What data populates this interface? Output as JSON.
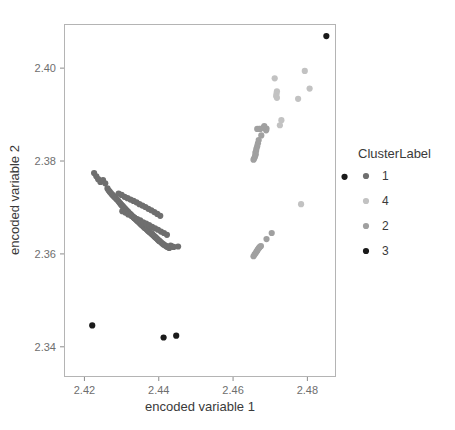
{
  "chart_data": {
    "type": "scatter",
    "title": "",
    "xlabel": "encoded variable 1",
    "ylabel": "encoded variable 2",
    "xlim": [
      2.4145,
      2.4877
    ],
    "ylim": [
      2.3335,
      2.4095
    ],
    "xticks": [
      2.42,
      2.44,
      2.46,
      2.48
    ],
    "xticklabels": [
      "2.42",
      "2.44",
      "2.46",
      "2.48"
    ],
    "yticks": [
      2.34,
      2.36,
      2.38,
      2.4
    ],
    "yticklabels": [
      "2.34",
      "2.36",
      "2.38",
      "2.40"
    ],
    "grid": false,
    "legend": {
      "title": "ClusterLabel",
      "position": "right",
      "entries": [
        {
          "label": "1",
          "color": "#6f6f6f"
        },
        {
          "label": "4",
          "color": "#c2c2c2"
        },
        {
          "label": "2",
          "color": "#a0a0a0"
        },
        {
          "label": "3",
          "color": "#1a1a1a"
        }
      ]
    },
    "marker_size": 3.1,
    "series": [
      {
        "name": "1",
        "color": "#6f6f6f",
        "points": [
          [
            2.4226,
            2.3774
          ],
          [
            2.4232,
            2.3767
          ],
          [
            2.4237,
            2.3761
          ],
          [
            2.4243,
            2.3755
          ],
          [
            2.425,
            2.3759
          ],
          [
            2.4256,
            2.3752
          ],
          [
            2.4262,
            2.3741
          ],
          [
            2.4265,
            2.3737
          ],
          [
            2.4268,
            2.3734
          ],
          [
            2.4271,
            2.3731
          ],
          [
            2.4274,
            2.3728
          ],
          [
            2.4277,
            2.3726
          ],
          [
            2.428,
            2.3723
          ],
          [
            2.4283,
            2.3721
          ],
          [
            2.4286,
            2.3718
          ],
          [
            2.4289,
            2.3716
          ],
          [
            2.4292,
            2.3713
          ],
          [
            2.4295,
            2.371
          ],
          [
            2.4297,
            2.3708
          ],
          [
            2.4299,
            2.3706
          ],
          [
            2.4301,
            2.3704
          ],
          [
            2.4303,
            2.3703
          ],
          [
            2.4305,
            2.3701
          ],
          [
            2.4307,
            2.3699
          ],
          [
            2.4309,
            2.3697
          ],
          [
            2.4311,
            2.3696
          ],
          [
            2.4313,
            2.3694
          ],
          [
            2.4315,
            2.3692
          ],
          [
            2.4317,
            2.3691
          ],
          [
            2.4319,
            2.3689
          ],
          [
            2.4321,
            2.3687
          ],
          [
            2.4323,
            2.3686
          ],
          [
            2.4325,
            2.3684
          ],
          [
            2.4327,
            2.3683
          ],
          [
            2.4329,
            2.3681
          ],
          [
            2.4331,
            2.368
          ],
          [
            2.4333,
            2.3678
          ],
          [
            2.4335,
            2.3677
          ],
          [
            2.4337,
            2.3675
          ],
          [
            2.4339,
            2.3674
          ],
          [
            2.4341,
            2.3672
          ],
          [
            2.4343,
            2.3671
          ],
          [
            2.4345,
            2.3669
          ],
          [
            2.4347,
            2.3668
          ],
          [
            2.4349,
            2.3666
          ],
          [
            2.4351,
            2.3665
          ],
          [
            2.4353,
            2.3663
          ],
          [
            2.4355,
            2.3662
          ],
          [
            2.4357,
            2.366
          ],
          [
            2.4359,
            2.3659
          ],
          [
            2.4361,
            2.3657
          ],
          [
            2.4363,
            2.3656
          ],
          [
            2.4365,
            2.3655
          ],
          [
            2.4367,
            2.3653
          ],
          [
            2.4369,
            2.3652
          ],
          [
            2.4371,
            2.365
          ],
          [
            2.4373,
            2.3649
          ],
          [
            2.4375,
            2.3647
          ],
          [
            2.4377,
            2.3646
          ],
          [
            2.4379,
            2.3645
          ],
          [
            2.4381,
            2.3643
          ],
          [
            2.4383,
            2.3642
          ],
          [
            2.4385,
            2.364
          ],
          [
            2.4387,
            2.3639
          ],
          [
            2.4389,
            2.3637
          ],
          [
            2.4391,
            2.3636
          ],
          [
            2.4393,
            2.3634
          ],
          [
            2.4395,
            2.3633
          ],
          [
            2.4397,
            2.3631
          ],
          [
            2.4399,
            2.363
          ],
          [
            2.4401,
            2.3628
          ],
          [
            2.4403,
            2.3627
          ],
          [
            2.4406,
            2.3625
          ],
          [
            2.4409,
            2.3623
          ],
          [
            2.4412,
            2.3621
          ],
          [
            2.4415,
            2.3619
          ],
          [
            2.4418,
            2.3618
          ],
          [
            2.4421,
            2.3616
          ],
          [
            2.4424,
            2.3615
          ],
          [
            2.4428,
            2.3613
          ],
          [
            2.4432,
            2.3618
          ],
          [
            2.4436,
            2.3616
          ],
          [
            2.4404,
            2.3682
          ],
          [
            2.4396,
            2.3686
          ],
          [
            2.4388,
            2.369
          ],
          [
            2.438,
            2.3694
          ],
          [
            2.4372,
            2.3697
          ],
          [
            2.4364,
            2.3701
          ],
          [
            2.4356,
            2.3704
          ],
          [
            2.4348,
            2.3707
          ],
          [
            2.434,
            2.3711
          ],
          [
            2.4332,
            2.3714
          ],
          [
            2.4324,
            2.3717
          ],
          [
            2.4316,
            2.372
          ],
          [
            2.4308,
            2.3723
          ],
          [
            2.43,
            2.3727
          ],
          [
            2.4292,
            2.373
          ],
          [
            2.4302,
            2.3692
          ],
          [
            2.431,
            2.3689
          ],
          [
            2.4318,
            2.3685
          ],
          [
            2.4326,
            2.3682
          ],
          [
            2.4334,
            2.3678
          ],
          [
            2.4342,
            2.3675
          ],
          [
            2.435,
            2.3672
          ],
          [
            2.4358,
            2.3668
          ],
          [
            2.4366,
            2.3665
          ],
          [
            2.4374,
            2.3662
          ],
          [
            2.4382,
            2.3658
          ],
          [
            2.439,
            2.3655
          ],
          [
            2.4398,
            2.3652
          ],
          [
            2.4406,
            2.3648
          ],
          [
            2.4414,
            2.3645
          ],
          [
            2.4422,
            2.3641
          ],
          [
            2.444,
            2.3615
          ],
          [
            2.4452,
            2.3616
          ]
        ]
      },
      {
        "name": "2",
        "color": "#a0a0a0",
        "points": [
          [
            2.4655,
            2.3803
          ],
          [
            2.4657,
            2.3806
          ],
          [
            2.4659,
            2.381
          ],
          [
            2.4661,
            2.3814
          ],
          [
            2.466,
            2.3818
          ],
          [
            2.4662,
            2.3822
          ],
          [
            2.4663,
            2.3827
          ],
          [
            2.4665,
            2.3832
          ],
          [
            2.4667,
            2.3838
          ],
          [
            2.4669,
            2.3845
          ],
          [
            2.4676,
            2.3855
          ],
          [
            2.4689,
            2.3866
          ],
          [
            2.469,
            2.387
          ],
          [
            2.4665,
            2.3869
          ],
          [
            2.467,
            2.3869
          ],
          [
            2.4673,
            2.3869
          ],
          [
            2.4682,
            2.3872
          ],
          [
            2.4684,
            2.3875
          ],
          [
            2.4655,
            2.3595
          ],
          [
            2.4658,
            2.3599
          ],
          [
            2.4661,
            2.3602
          ],
          [
            2.4663,
            2.3605
          ],
          [
            2.4665,
            2.3607
          ],
          [
            2.4667,
            2.361
          ],
          [
            2.4669,
            2.3612
          ],
          [
            2.4671,
            2.3614
          ],
          [
            2.4673,
            2.3616
          ],
          [
            2.4675,
            2.3617
          ],
          [
            2.469,
            2.3632
          ],
          [
            2.4704,
            2.3645
          ]
        ]
      },
      {
        "name": "4",
        "color": "#c2c2c2",
        "points": [
          [
            2.4712,
            2.3978
          ],
          [
            2.4793,
            2.3994
          ],
          [
            2.4718,
            2.395
          ],
          [
            2.4717,
            2.3945
          ],
          [
            2.4716,
            2.394
          ],
          [
            2.4718,
            2.3936
          ],
          [
            2.4806,
            2.3956
          ],
          [
            2.4775,
            2.3934
          ],
          [
            2.473,
            2.3888
          ],
          [
            2.4726,
            2.3877
          ],
          [
            2.4783,
            2.3707
          ]
        ]
      },
      {
        "name": "3",
        "color": "#1a1a1a",
        "points": [
          [
            2.4851,
            2.4069
          ],
          [
            2.49,
            2.3766
          ],
          [
            2.4221,
            2.3446
          ],
          [
            2.4413,
            2.342
          ],
          [
            2.4447,
            2.3424
          ]
        ]
      }
    ]
  },
  "layout": {
    "panel": {
      "left": 64,
      "top": 24,
      "right": 336,
      "bottom": 377
    },
    "legend_origin": {
      "x": 358,
      "y": 158
    }
  }
}
